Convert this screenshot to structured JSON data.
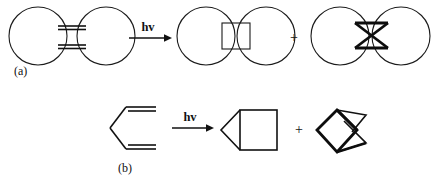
{
  "figure": {
    "background_color": "#ffffff",
    "stroke_color": "#111111",
    "width": 438,
    "height": 180
  },
  "schemes": [
    {
      "id": "scheme-a",
      "label": "(a)",
      "label_x": 14,
      "label_y": 75,
      "reactant": {
        "name": "bis-macrocyclic-diene",
        "description": "two large rings bridged by two parallel double bonds"
      },
      "arrow": {
        "label": "hv",
        "label_x": 143,
        "label_y": 30,
        "x1": 129,
        "x2": 168,
        "y": 38
      },
      "products": [
        {
          "name": "straight-cycloadduct",
          "description": "two rings joined by a cyclobutane square"
        },
        {
          "name": "crossed-cycloadduct",
          "description": "two rings joined by a crossed bowtie bicyclobutane"
        }
      ],
      "plus": {
        "symbol": "+",
        "x": 291,
        "y": 42
      }
    },
    {
      "id": "scheme-b",
      "label": "(b)",
      "label_x": 118,
      "label_y": 173,
      "reactant": {
        "name": "hexadiene",
        "description": "1,5-hexadiene drawn as a chevron with two terminal double bonds"
      },
      "arrow": {
        "label": "hv",
        "label_x": 184,
        "label_y": 120,
        "x1": 172,
        "x2": 211,
        "y": 128
      },
      "products": [
        {
          "name": "bicyclopentane-housane",
          "description": "square fused to a triangle (straight closure)"
        },
        {
          "name": "crossed-bicyclopentane",
          "description": "crossed bicyclic cage (crossed closure)"
        }
      ],
      "plus": {
        "symbol": "+",
        "x": 294,
        "y": 133
      }
    }
  ],
  "annotations": {
    "hv_symbol": "hv",
    "plus_symbol": "+",
    "label_a": "(a)",
    "label_b": "(b)"
  }
}
